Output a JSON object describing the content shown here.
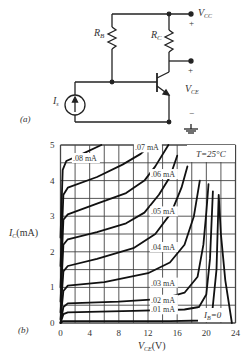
{
  "circuit": {
    "label": "(a)",
    "rb_label": "R",
    "rb_sub": "B",
    "rc_label": "R",
    "rc_sub": "C",
    "vcc_label": "V",
    "vcc_sub": "CC",
    "vce_label": "V",
    "vce_sub": "CE",
    "is_label": "I",
    "is_sub": "s",
    "plus": "+",
    "minus": "−"
  },
  "chart_data": {
    "type": "line",
    "panel_label": "(b)",
    "title": "",
    "annotation": "T=25°C",
    "xlabel": "V_CE (V)",
    "ylabel": "I_C (mA)",
    "xlabel_main": "V",
    "xlabel_sub": "CE",
    "xlabel_unit": "(V)",
    "ylabel_main": "I",
    "ylabel_sub": "C",
    "ylabel_unit": "(mA)",
    "xlim": [
      0,
      24
    ],
    "ylim": [
      0,
      5
    ],
    "x_ticks": [
      0,
      4,
      8,
      12,
      16,
      20,
      24
    ],
    "y_ticks": [
      0,
      1,
      2,
      3,
      4,
      5
    ],
    "grid": true,
    "grid_x_step": 2,
    "grid_y_step": 0.5,
    "series": [
      {
        "name": "I_B=0",
        "label": "I_B=0",
        "points": [
          [
            0,
            0
          ],
          [
            0.3,
            0.05
          ],
          [
            5,
            0.05
          ],
          [
            15,
            0.05
          ],
          [
            19.5,
            0.07
          ],
          [
            20.8,
            0.3
          ],
          [
            21.4,
            1.5
          ],
          [
            21.7,
            3.6
          ],
          [
            22,
            2.5
          ],
          [
            22.6,
            1.2
          ],
          [
            23.5,
            0
          ]
        ]
      },
      {
        "name": ".01 mA",
        "label": ".01 mA",
        "points": [
          [
            0,
            0
          ],
          [
            0.4,
            0.25
          ],
          [
            1,
            0.3
          ],
          [
            10,
            0.34
          ],
          [
            17,
            0.38
          ],
          [
            19,
            0.45
          ],
          [
            20,
            0.8
          ],
          [
            20.5,
            1.8
          ],
          [
            20.9,
            3.7
          ]
        ]
      },
      {
        "name": ".02 mA",
        "label": ".02 mA",
        "points": [
          [
            0,
            0
          ],
          [
            0.4,
            0.45
          ],
          [
            1,
            0.55
          ],
          [
            8,
            0.6
          ],
          [
            14,
            0.68
          ],
          [
            17,
            0.85
          ],
          [
            18.8,
            1.3
          ],
          [
            19.6,
            2.2
          ],
          [
            20,
            3.1
          ],
          [
            20.3,
            3.9
          ]
        ]
      },
      {
        "name": ".03 mA",
        "label": ".03 mA",
        "points": [
          [
            0,
            0.1
          ],
          [
            0.4,
            0.9
          ],
          [
            1,
            1.05
          ],
          [
            6,
            1.15
          ],
          [
            12,
            1.4
          ],
          [
            15,
            1.7
          ],
          [
            17,
            2.2
          ],
          [
            18.3,
            3.0
          ],
          [
            19.1,
            4.0
          ]
        ]
      },
      {
        "name": ".04 mA",
        "label": ".04 mA",
        "points": [
          [
            0,
            0.3
          ],
          [
            0.4,
            1.45
          ],
          [
            1,
            1.6
          ],
          [
            5,
            1.8
          ],
          [
            10,
            2.1
          ],
          [
            13,
            2.5
          ],
          [
            15.2,
            3.1
          ],
          [
            16.6,
            3.8
          ],
          [
            17.4,
            4.4
          ]
        ]
      },
      {
        "name": ".05 mA",
        "label": ".05 mA",
        "points": [
          [
            0,
            0.6
          ],
          [
            0.4,
            2.2
          ],
          [
            1,
            2.35
          ],
          [
            5,
            2.55
          ],
          [
            9,
            2.8
          ],
          [
            11.5,
            3.1
          ],
          [
            13.5,
            3.6
          ],
          [
            15,
            4.1
          ],
          [
            16,
            4.7
          ]
        ]
      },
      {
        "name": ".06 mA",
        "label": ".06 mA",
        "points": [
          [
            0,
            1.0
          ],
          [
            0.4,
            2.9
          ],
          [
            1,
            3.05
          ],
          [
            5,
            3.35
          ],
          [
            9,
            3.65
          ],
          [
            11.5,
            4.0
          ],
          [
            13,
            4.4
          ],
          [
            14.8,
            5.0
          ]
        ]
      },
      {
        "name": ".07 mA",
        "label": ".07 mA",
        "points": [
          [
            0,
            1.6
          ],
          [
            0.4,
            3.6
          ],
          [
            1,
            3.8
          ],
          [
            5,
            4.1
          ],
          [
            8.5,
            4.45
          ],
          [
            11,
            4.75
          ],
          [
            12.4,
            5.0
          ]
        ]
      },
      {
        "name": ".08 mA",
        "label": ".08 mA",
        "points": [
          [
            0,
            2.4
          ],
          [
            0.3,
            4.3
          ],
          [
            0.8,
            4.55
          ],
          [
            3,
            4.75
          ],
          [
            5.6,
            5.0
          ]
        ]
      }
    ],
    "curve_labels": [
      {
        "text": ".08 mA",
        "v": 1.7,
        "i": 4.55
      },
      {
        "text": ".07 mA",
        "v": 10.2,
        "i": 4.85
      },
      {
        "text": ".06 mA",
        "v": 12.4,
        "i": 4.1
      },
      {
        "text": ".05 mA",
        "v": 12.4,
        "i": 3.05
      },
      {
        "text": ".04 mA",
        "v": 12.4,
        "i": 2.05
      },
      {
        "text": ".03 mA",
        "v": 12.4,
        "i": 1.05
      },
      {
        "text": ".02 mA",
        "v": 12.4,
        "i": 0.57
      },
      {
        "text": ".01 mA",
        "v": 12.4,
        "i": 0.3
      }
    ]
  }
}
